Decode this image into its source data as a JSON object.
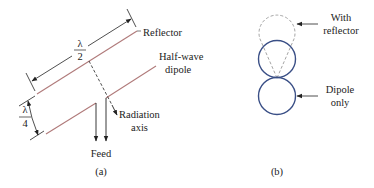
{
  "figure_a": {
    "labels": {
      "reflector": "Reflector",
      "half_wave_line1": "Half-wave",
      "half_wave_line2": "dipole",
      "radiation_line1": "Radiation",
      "radiation_line2": "axis",
      "feed": "Feed",
      "caption": "(a)"
    },
    "dimensions": {
      "half_lambda_num": "λ",
      "half_lambda_den": "2",
      "quarter_lambda_num": "λ",
      "quarter_lambda_den": "4"
    }
  },
  "figure_b": {
    "labels": {
      "with_reflector_line1": "With",
      "with_reflector_line2": "reflector",
      "dipole_only_line1": "Dipole",
      "dipole_only_line2": "only",
      "caption": "(b)"
    }
  },
  "colors": {
    "element_line": "#b07a7a",
    "pattern_solid": "#3a4f86",
    "pattern_dashed": "#9a9a9a",
    "ink": "#222222"
  }
}
